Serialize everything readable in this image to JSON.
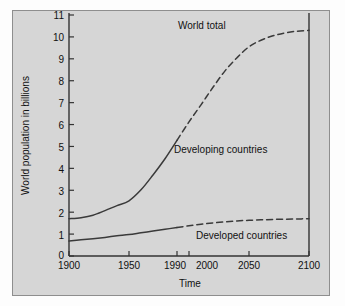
{
  "chart_data": {
    "type": "line",
    "title": "",
    "xlabel": "Time",
    "ylabel": "World population in billions",
    "xlim": [
      1900,
      2100
    ],
    "ylim": [
      0,
      11
    ],
    "grid": false,
    "legend_position": "inline-annotations",
    "xticks": [
      {
        "value": 1900,
        "label": "1900"
      },
      {
        "value": 1950,
        "label": "1950"
      },
      {
        "value": 1990,
        "label": "1990"
      },
      {
        "value": 2000,
        "label": "2000"
      },
      {
        "value": 2050,
        "label": "2050"
      },
      {
        "value": 2100,
        "label": "2100"
      }
    ],
    "yticks": [
      {
        "value": 0,
        "label": "0"
      },
      {
        "value": 1,
        "label": "1"
      },
      {
        "value": 2,
        "label": "2"
      },
      {
        "value": 3,
        "label": "3"
      },
      {
        "value": 4,
        "label": "4"
      },
      {
        "value": 5,
        "label": "5"
      },
      {
        "value": 6,
        "label": "6"
      },
      {
        "value": 7,
        "label": "7"
      },
      {
        "value": 8,
        "label": "8"
      },
      {
        "value": 9,
        "label": "9"
      },
      {
        "value": 10,
        "label": "10"
      },
      {
        "value": 11,
        "label": "11"
      }
    ],
    "annotations": [
      {
        "id": "world-total",
        "text": "World total",
        "x": 2005,
        "y": 10.6
      },
      {
        "id": "developing-countries",
        "text": "Developing countries",
        "x": 2003,
        "y": 5.0
      },
      {
        "id": "developed-countries",
        "text": "Developed countries",
        "x": 2008,
        "y": 1.0
      }
    ],
    "series": [
      {
        "name": "World total",
        "style_historical": "solid",
        "style_projected": "dashed",
        "split_year": 1990,
        "x": [
          1900,
          1910,
          1920,
          1930,
          1940,
          1950,
          1960,
          1970,
          1980,
          1990,
          2000,
          2010,
          2020,
          2030,
          2040,
          2050,
          2060,
          2070,
          2080,
          2090,
          2100
        ],
        "y": [
          1.7,
          1.75,
          1.86,
          2.07,
          2.3,
          2.52,
          3.02,
          3.7,
          4.44,
          5.28,
          6.12,
          6.9,
          7.7,
          8.45,
          9.05,
          9.55,
          9.85,
          10.05,
          10.18,
          10.26,
          10.3
        ]
      },
      {
        "name": "Developed countries",
        "style_historical": "solid",
        "style_projected": "dashed",
        "split_year": 1990,
        "x": [
          1900,
          1910,
          1920,
          1930,
          1940,
          1950,
          1960,
          1970,
          1980,
          1990,
          2000,
          2010,
          2020,
          2030,
          2040,
          2050,
          2060,
          2070,
          2080,
          2090,
          2100
        ],
        "y": [
          0.68,
          0.74,
          0.79,
          0.85,
          0.92,
          0.98,
          1.06,
          1.14,
          1.22,
          1.3,
          1.38,
          1.45,
          1.51,
          1.56,
          1.6,
          1.63,
          1.65,
          1.67,
          1.68,
          1.69,
          1.7
        ]
      }
    ],
    "colors": {
      "background": "#d6d6d6",
      "axis": "#333333",
      "line": "#3a3a3a",
      "text": "#111111"
    }
  }
}
